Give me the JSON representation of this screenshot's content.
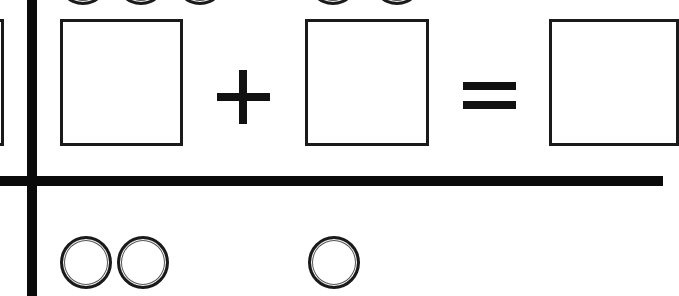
{
  "worksheet": {
    "type": "addition-equation-row",
    "operators": {
      "plus": "+",
      "equals": "="
    },
    "top_row": {
      "circle_groups": [
        {
          "count": 3,
          "position": "above-first-addend"
        },
        {
          "count": 2,
          "position": "above-second-addend"
        }
      ]
    },
    "equation": {
      "addend_1_box": "",
      "addend_2_box": "",
      "sum_box": ""
    },
    "bottom_row": {
      "circle_groups": [
        {
          "count": 2,
          "position": "first-addend"
        },
        {
          "count": 1,
          "position": "second-addend"
        }
      ]
    },
    "colors": {
      "line": "#0a0a0a",
      "background": "#ffffff"
    }
  }
}
